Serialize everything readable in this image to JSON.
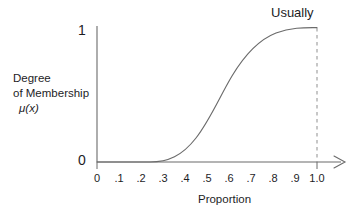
{
  "chart_data": {
    "type": "line",
    "title": "",
    "annotations": [
      {
        "text": "Usually",
        "x": 1.0,
        "y": 1.0
      }
    ],
    "xlabel": "Proportion",
    "ylabel": "Degree of Membership μ(x)",
    "ylabel_lines": [
      "Degree",
      "of Membership",
      "μ(x)"
    ],
    "xlim": [
      0,
      1.0
    ],
    "ylim": [
      0,
      1
    ],
    "xticks": [
      0,
      0.1,
      0.2,
      0.3,
      0.4,
      0.5,
      0.6,
      0.7,
      0.8,
      0.9,
      1.0
    ],
    "xticklabels": [
      "0",
      ".1",
      ".2",
      ".3",
      ".4",
      ".5",
      ".6",
      ".7",
      ".8",
      ".9",
      "1.0"
    ],
    "yticks": [
      0,
      1
    ],
    "yticklabels": [
      "0",
      "1"
    ],
    "grid": false,
    "legend": "none",
    "series": [
      {
        "name": "Usually",
        "color": "#6b6b6b",
        "linestyle": "solid",
        "x": [
          0.0,
          0.05,
          0.1,
          0.15,
          0.2,
          0.25,
          0.27,
          0.3,
          0.33,
          0.36,
          0.4,
          0.43,
          0.46,
          0.5,
          0.53,
          0.56,
          0.6,
          0.63,
          0.66,
          0.7,
          0.73,
          0.76,
          0.8,
          0.83,
          0.86,
          0.9,
          0.93,
          0.96,
          1.0
        ],
        "y": [
          0.0,
          0.0,
          0.0,
          0.0,
          0.0,
          0.005,
          0.01,
          0.03,
          0.055,
          0.085,
          0.14,
          0.19,
          0.25,
          0.345,
          0.425,
          0.505,
          0.615,
          0.69,
          0.755,
          0.83,
          0.872,
          0.906,
          0.942,
          0.96,
          0.974,
          0.988,
          0.994,
          0.998,
          1.0
        ]
      }
    ],
    "reference_lines": [
      {
        "name": "usually-reference-line",
        "orientation": "vertical",
        "x": 1.0,
        "linestyle": "dashed",
        "color": "#9a9a9a"
      }
    ],
    "axis_arrows": {
      "x": true,
      "y": false
    },
    "axis_color": "#6b6b6b",
    "background": "#ffffff"
  },
  "figure": {
    "curve_label": "Usually"
  }
}
